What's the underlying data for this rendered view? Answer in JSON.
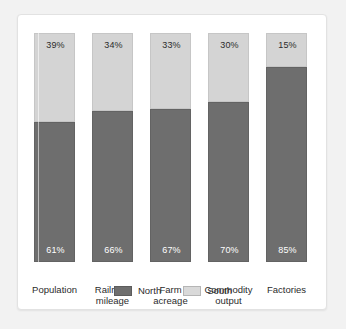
{
  "chart_data": {
    "type": "bar",
    "subtype": "stacked-100-percent",
    "title": "",
    "subtitle": "",
    "xlabel": "",
    "ylabel": "",
    "ylim": [
      0,
      100
    ],
    "grid": false,
    "legend_position": "bottom-center",
    "categories": [
      "Population",
      "Railroad mileage",
      "Farm acreage",
      "Commodity output",
      "Factories"
    ],
    "series": [
      {
        "name": "North",
        "color": "#6e6e6e",
        "values": [
          61,
          66,
          67,
          70,
          85
        ],
        "labels": [
          "61%",
          "66%",
          "67%",
          "70%",
          "85%"
        ]
      },
      {
        "name": "South",
        "color": "#d4d4d4",
        "values": [
          39,
          34,
          33,
          30,
          15
        ],
        "labels": [
          "39%",
          "34%",
          "33%",
          "30%",
          "15%"
        ]
      }
    ]
  },
  "legend": {
    "entries": [
      {
        "label": "North",
        "color": "#6e6e6e"
      },
      {
        "label": "South",
        "color": "#d4d4d4"
      }
    ]
  },
  "colors": {
    "north": "#6e6e6e",
    "south": "#d4d4d4",
    "card_background": "#ffffff",
    "page_background": "#f2f2f2",
    "text": "#2b2b2b",
    "label_on_dark": "#ffffff"
  },
  "bars": [
    {
      "category": "Population",
      "category_line1": "Population",
      "category_line2": "",
      "south_label": "39%",
      "north_label": "61%",
      "south_value": 39,
      "north_value": 61
    },
    {
      "category": "Railroad mileage",
      "category_line1": "Railroad",
      "category_line2": "mileage",
      "south_label": "34%",
      "north_label": "66%",
      "south_value": 34,
      "north_value": 66
    },
    {
      "category": "Farm acreage",
      "category_line1": "Farm",
      "category_line2": "acreage",
      "south_label": "33%",
      "north_label": "67%",
      "south_value": 33,
      "north_value": 67
    },
    {
      "category": "Commodity output",
      "category_line1": "Commodity",
      "category_line2": "output",
      "south_label": "30%",
      "north_label": "70%",
      "south_value": 30,
      "north_value": 70
    },
    {
      "category": "Factories",
      "category_line1": "Factories",
      "category_line2": "",
      "south_label": "15%",
      "north_label": "85%",
      "south_value": 15,
      "north_value": 85
    }
  ]
}
